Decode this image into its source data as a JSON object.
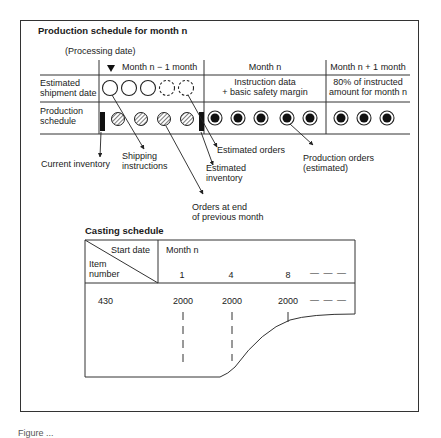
{
  "production_schedule": {
    "title": "Production schedule for month n",
    "processing_date_label": "(Processing date)",
    "columns": {
      "prev_month": "Month n − 1 month",
      "month_n": "Month n",
      "next_month": "Month n + 1 month"
    },
    "rows": {
      "estimated_shipment_label_1": "Estimated",
      "estimated_shipment_label_2": "shipment date",
      "production_schedule_label_1": "Production",
      "production_schedule_label_2": "schedule"
    },
    "month_n_shipment_1": "Instruction data",
    "month_n_shipment_2": "+ basic safety margin",
    "next_month_shipment_1": "80% of instructed",
    "next_month_shipment_2": "amount for month n",
    "callouts": {
      "current_inventory": "Current inventory",
      "shipping_instructions_1": "Shipping",
      "shipping_instructions_2": "instructions",
      "estimated_inventory_1": "Estimated",
      "estimated_inventory_2": "inventory",
      "estimated_orders": "Estimated orders",
      "orders_end_prev_1": "Orders at end",
      "orders_end_prev_2": "of previous month",
      "production_orders_1": "Production orders",
      "production_orders_2": "(estimated)"
    },
    "icons": {
      "marker": "down-triangle-marker",
      "shipment_solid": "open-circle",
      "shipment_estimated": "dashed-circle",
      "shipping_instruction": "hatched-circle",
      "production_order": "filled-ring-circle",
      "inventory": "black-bar"
    }
  },
  "casting_schedule": {
    "title": "Casting schedule",
    "header_corner_top": "Start date",
    "header_corner_bottom_1": "Item",
    "header_corner_bottom_2": "number",
    "month_label": "Month n",
    "start_dates": [
      "1",
      "4",
      "8",
      "— — —"
    ],
    "rows": [
      {
        "item": "430",
        "values": [
          "2000",
          "2000",
          "2000",
          "— — —"
        ]
      }
    ]
  },
  "caption": "Figure ..."
}
